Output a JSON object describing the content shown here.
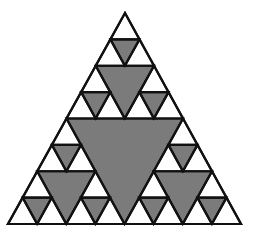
{
  "diagram": {
    "type": "sierpinski-triangle",
    "depth": 3,
    "outer_triangle": {
      "apex": [
        125,
        13
      ],
      "bottom_left": [
        8,
        224
      ],
      "bottom_right": [
        241,
        224
      ]
    },
    "colors": {
      "background": "#ffffff",
      "fill_removed": "#7b7b7b",
      "stroke": "#111111"
    },
    "stroke_width": 2.2,
    "hole_count": 13
  }
}
